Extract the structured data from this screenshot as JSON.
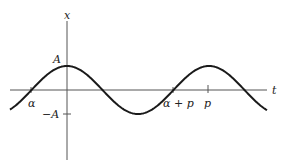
{
  "diagram": {
    "type": "periodic-function-graph",
    "axes": {
      "horizontal_label": "t",
      "vertical_label": "x"
    },
    "labels": {
      "amplitude_pos": "A",
      "amplitude_neg": "−A",
      "alpha": "α",
      "alpha_plus_p": "α + p",
      "period": "p"
    },
    "curve": {
      "shape": "cosine",
      "description": "x = A cos(2π t / p), crossing zero at α and α + p, peak at t = 0 and t = p"
    },
    "colors": {
      "curve": "#1a1a1a",
      "axis": "#555555",
      "background": "#ffffff"
    }
  }
}
